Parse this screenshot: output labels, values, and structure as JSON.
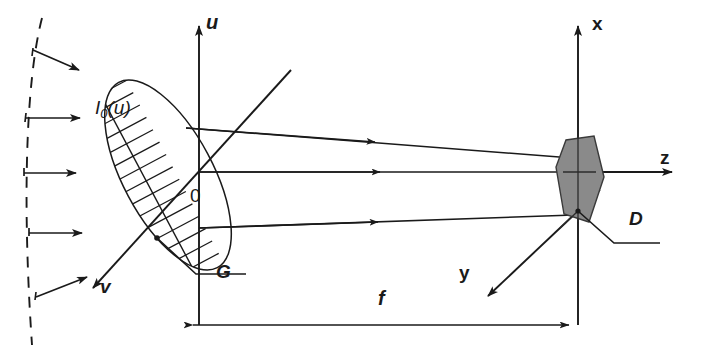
{
  "figure": {
    "type": "optical-ray-diagram",
    "background_color": "#ffffff",
    "ink_color": "#1a1a1a",
    "detector_fill": "#8a8a8a"
  },
  "labels": {
    "u_axis": "u",
    "v_axis": "v",
    "x_axis": "x",
    "y_axis": "y",
    "z_axis": "z",
    "origin": "0",
    "grating": "G",
    "detector": "D",
    "focal_length": "f",
    "incident_intensity": "I",
    "incident_intensity_sub": "0",
    "incident_intensity_arg": "(u)"
  },
  "elements": {
    "wavefront": {
      "name": "dashed-wavefront-arc",
      "style": "dashed",
      "arrow_count": 5
    },
    "grating": {
      "name": "grating-ellipse",
      "hatched": true,
      "hatch_count": 16
    },
    "rays": {
      "name": "ray-bundle",
      "count": 3
    },
    "detector": {
      "name": "detector-plane",
      "shape": "slanted-hexagon",
      "fill": "#8a8a8a"
    },
    "dimension": {
      "name": "focal-length-dimension",
      "label": "f",
      "arrows": "double"
    }
  }
}
